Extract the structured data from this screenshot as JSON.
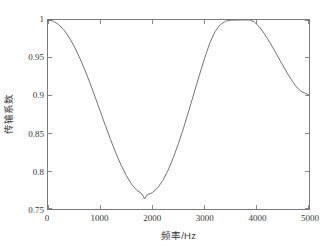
{
  "chart_data": {
    "type": "line",
    "title": "",
    "xlabel": "频率/Hz",
    "ylabel": "传输系数",
    "xlim": [
      0,
      5000
    ],
    "ylim": [
      0.75,
      1.0
    ],
    "grid": false,
    "legend": null,
    "xticks": [
      0,
      1000,
      2000,
      3000,
      4000,
      5000
    ],
    "xtick_labels": [
      "0",
      "1000",
      "2000",
      "3000",
      "4000",
      "5000"
    ],
    "yticks": [
      0.75,
      0.8,
      0.85,
      0.9,
      0.95,
      1
    ],
    "ytick_labels": [
      "0.75",
      "0.8",
      "0.85",
      "0.9",
      "0.95",
      "1"
    ],
    "series": [
      {
        "name": "传输系数",
        "color": "#6b6b6b",
        "x": [
          0,
          100,
          200,
          300,
          400,
          500,
          600,
          700,
          800,
          900,
          1000,
          1100,
          1200,
          1300,
          1400,
          1500,
          1600,
          1700,
          1800,
          1850,
          1900,
          2000,
          2100,
          2200,
          2300,
          2400,
          2500,
          2600,
          2700,
          2800,
          2900,
          3000,
          3100,
          3200,
          3300,
          3400,
          3500,
          3600,
          3700,
          3800,
          3870,
          3950,
          4050,
          4150,
          4250,
          4350,
          4450,
          4550,
          4650,
          4750,
          4850,
          5000
        ],
        "y": [
          1.0,
          0.9985,
          0.9942,
          0.9872,
          0.9775,
          0.9654,
          0.9511,
          0.935,
          0.9174,
          0.8987,
          0.8795,
          0.8603,
          0.8416,
          0.824,
          0.808,
          0.7942,
          0.7829,
          0.7748,
          0.7699,
          0.7632,
          0.7689,
          0.7716,
          0.7779,
          0.7878,
          0.8012,
          0.8177,
          0.8368,
          0.858,
          0.8806,
          0.9039,
          0.9271,
          0.9494,
          0.9696,
          0.9846,
          0.9938,
          0.9985,
          0.9997,
          0.9999,
          1.0,
          1.0,
          1.0,
          0.9976,
          0.9908,
          0.9814,
          0.9703,
          0.9583,
          0.9459,
          0.9338,
          0.9224,
          0.912,
          0.9056,
          0.9008
        ]
      }
    ]
  }
}
